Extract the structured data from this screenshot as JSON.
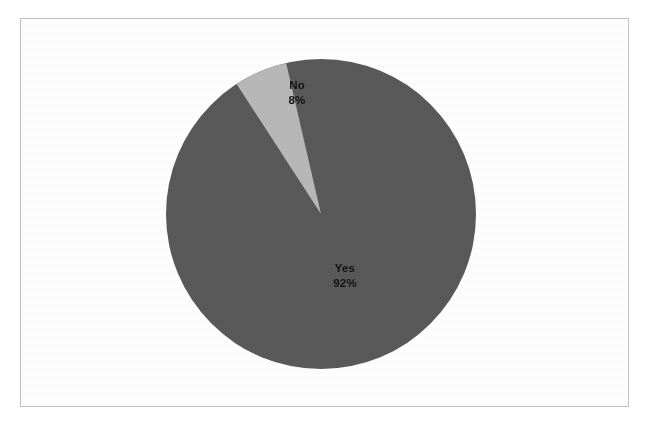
{
  "page": {
    "background_color": "#ffffff",
    "frame_color": "#c2c2c2"
  },
  "chart_data": {
    "type": "pie",
    "title": "",
    "subtitle": "",
    "xlabel": "",
    "ylabel": "",
    "legend": "none",
    "grid": false,
    "labels_on_slices": true,
    "categories": [
      "Yes",
      "No"
    ],
    "values": [
      92,
      8
    ],
    "value_suffix": "%",
    "colors": [
      "#595959",
      "#b8b8b8"
    ],
    "start_angle_deg": -33,
    "direction": "clockwise",
    "slices": [
      {
        "name": "Yes",
        "label": "Yes",
        "value": 92,
        "value_label": "92%",
        "color": "#595959",
        "start_angle_deg": -13,
        "end_angle_deg": 327
      },
      {
        "name": "No",
        "label": "No",
        "value": 8,
        "value_label": "8%",
        "color": "#b8b8b8",
        "start_angle_deg": -33,
        "end_angle_deg": -13
      }
    ],
    "geometry": {
      "center_x": 321,
      "center_y": 214,
      "radius": 155
    }
  }
}
